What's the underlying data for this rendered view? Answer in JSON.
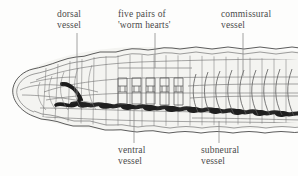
{
  "figure": {
    "type": "biological-diagram",
    "background_color": "#fdfdfc",
    "ink_color": "#3b3b3b",
    "label_color": "#4a4a4a",
    "vessel_fill_color": "#2b2b2b",
    "body_tint_color": "#f2f2ef"
  },
  "labels": {
    "dorsal": {
      "line1": "dorsal",
      "line2": "vessel"
    },
    "hearts": {
      "line1": "five pairs of",
      "line2": "'worm hearts'"
    },
    "commissural": {
      "line1": "commissural",
      "line2": "vessel"
    },
    "ventral": {
      "line1": "ventral",
      "line2": "vessel"
    },
    "subneural": {
      "line1": "subneural",
      "line2": "vessel"
    }
  },
  "leaders": {
    "dorsal": {
      "from": [
        77,
        33
      ],
      "to": [
        77,
        95
      ]
    },
    "hearts": {
      "from": [
        155,
        33
      ],
      "to": [
        155,
        68
      ],
      "bracket": [
        118,
        68,
        192,
        68
      ]
    },
    "commissural": {
      "from": [
        243,
        33
      ],
      "to": [
        243,
        76
      ]
    },
    "ventral": {
      "from": [
        134,
        143
      ],
      "to": [
        134,
        110
      ]
    },
    "subneural": {
      "from": [
        219,
        143
      ],
      "to": [
        219,
        121
      ]
    }
  },
  "anatomy": {
    "segment_count": 22,
    "heart_pairs": 5,
    "heart_x_positions": [
      120,
      134,
      148,
      162,
      176
    ],
    "ventral_vessel_beads": 11
  }
}
